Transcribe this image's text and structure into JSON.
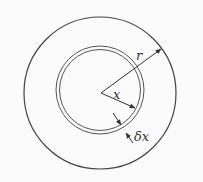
{
  "diagram": {
    "type": "concentric-circles",
    "background": "#fbfbfb",
    "stroke_color": "#444444",
    "outer_circle": {
      "cx": 100,
      "cy": 93,
      "r": 76
    },
    "thin_shell_outer": {
      "cx": 100,
      "cy": 90,
      "r": 44
    },
    "thin_shell_inner": {
      "cx": 100,
      "cy": 90,
      "r": 40.5
    },
    "center_point": {
      "x": 101,
      "y": 93
    },
    "labels": {
      "outer_radius": "r",
      "shell_radius": "x",
      "shell_thickness": "δx"
    }
  }
}
